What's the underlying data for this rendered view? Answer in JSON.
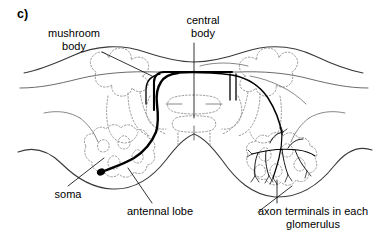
{
  "figure": {
    "panel_label": "c)",
    "caption_subject": "insect brain schematic",
    "background_color": "#ffffff",
    "line_color": "#000000",
    "dotted_outline_color": "#9a9a9a",
    "thin_line_color": "#555555"
  },
  "labels": [
    {
      "id": "mushroom-body",
      "text": "mushroom\nbody",
      "leader": "from text to left mushroom body outline"
    },
    {
      "id": "central-body",
      "text": "central\nbody",
      "leader": "vertical line down to central body"
    },
    {
      "id": "soma",
      "text": "soma",
      "leader": "diagonal line up-right to filled cell body"
    },
    {
      "id": "antennal-lobe",
      "text": "antennal lobe",
      "leader": "diagonal line up-left to left antennal lobe"
    },
    {
      "id": "axon-terminals",
      "text": "axon terminals in each\nglomerulus",
      "leader": "vertical line up to arborization in right antennal lobe"
    }
  ],
  "structures": {
    "mushroom_body_left": "scalloped dotted outline, upper left quadrant",
    "mushroom_body_right": "scalloped dotted outline, upper right quadrant",
    "central_body": "dotted midline structure between mushroom bodies",
    "antennal_lobe_left": "lumpy dotted outline, lower left",
    "antennal_lobe_right": "lumpy dotted outline, lower right",
    "neuron": "single projection neuron: soma in left antennal lobe, thick black axon running up and across midline to right side, branching into axon terminals in glomeruli of right antennal lobe"
  }
}
